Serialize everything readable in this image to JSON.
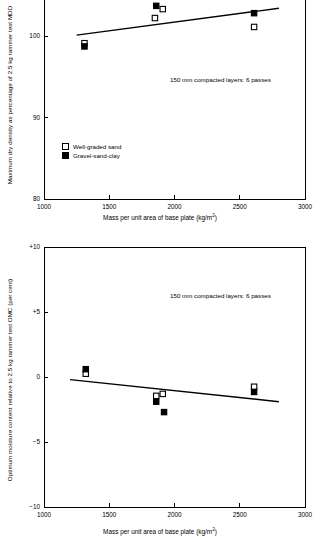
{
  "figure": {
    "background": "#ffffff",
    "ink": "#000000"
  },
  "panels": [
    {
      "id": "top",
      "annotation": "150 mm compacted layers: 6 passes",
      "legend": {
        "position": "inside-lower-left",
        "entries": [
          {
            "label": "Well-graded sand",
            "marker": "open-square",
            "color": "#ffffff"
          },
          {
            "label": "Gravel-sand-clay",
            "marker": "filled-square",
            "color": "#000000"
          }
        ]
      }
    },
    {
      "id": "bottom",
      "annotation": "150 mm compacted layers: 6 passes",
      "legend": null
    }
  ],
  "chart_data": [
    {
      "type": "scatter",
      "id": "maximum-dry-density",
      "title": "",
      "xlabel": "Mass per unit area of base plate (kg/m²)",
      "ylabel": "Maximum dry density as percentage of 2.5 kg rammer test MDD",
      "xlim": [
        1000,
        3000
      ],
      "ylim": [
        80,
        106
      ],
      "xticks": [
        1000,
        1500,
        2000,
        2500,
        3000
      ],
      "xticklabels": [
        "1000",
        "1500",
        "2000",
        "2500",
        "3000"
      ],
      "yticks": [
        80,
        90,
        100
      ],
      "yticklabels": [
        "80",
        "90",
        "100"
      ],
      "grid": false,
      "annotation": "150 mm compacted layers: 6 passes",
      "series": [
        {
          "name": "Well-graded sand",
          "marker": "open-square",
          "points": [
            {
              "x": 1310,
              "y": 99.2
            },
            {
              "x": 1850,
              "y": 102.3
            },
            {
              "x": 1910,
              "y": 103.4
            },
            {
              "x": 2610,
              "y": 101.2
            }
          ]
        },
        {
          "name": "Gravel-sand-clay",
          "marker": "filled-square",
          "points": [
            {
              "x": 1310,
              "y": 98.8
            },
            {
              "x": 1860,
              "y": 103.8
            },
            {
              "x": 1890,
              "y": 105.7
            },
            {
              "x": 2610,
              "y": 102.9
            }
          ]
        }
      ],
      "trendline": {
        "label": "best-fit",
        "x": [
          1250,
          2800
        ],
        "y": [
          100.2,
          103.5
        ]
      }
    },
    {
      "type": "scatter",
      "id": "optimum-moisture-content",
      "title": "",
      "xlabel": "Mass per unit area of base plate (kg/m²)",
      "ylabel": "Optimum moisture content relative to 2.5 kg rammer test OMC (per cent)",
      "xlim": [
        1000,
        3000
      ],
      "ylim": [
        -10,
        10
      ],
      "xticks": [
        1000,
        1500,
        2000,
        2500,
        3000
      ],
      "xticklabels": [
        "1000",
        "1500",
        "2000",
        "2500",
        "3000"
      ],
      "yticks": [
        -10,
        -5,
        0,
        5,
        10
      ],
      "yticklabels": [
        "−10",
        "−5",
        "0",
        "+5",
        "+10"
      ],
      "grid": false,
      "annotation": "150 mm compacted layers: 6 passes",
      "series": [
        {
          "name": "Well-graded sand",
          "marker": "open-square",
          "points": [
            {
              "x": 1320,
              "y": 0.25
            },
            {
              "x": 1860,
              "y": -1.45
            },
            {
              "x": 1910,
              "y": -1.3
            },
            {
              "x": 2610,
              "y": -0.75
            }
          ]
        },
        {
          "name": "Gravel-sand-clay",
          "marker": "filled-square",
          "points": [
            {
              "x": 1320,
              "y": 0.6
            },
            {
              "x": 1860,
              "y": -1.9
            },
            {
              "x": 1920,
              "y": -2.7
            },
            {
              "x": 2610,
              "y": -1.15
            }
          ]
        }
      ],
      "trendline": {
        "label": "best-fit",
        "x": [
          1200,
          2800
        ],
        "y": [
          -0.2,
          -1.9
        ]
      }
    }
  ]
}
